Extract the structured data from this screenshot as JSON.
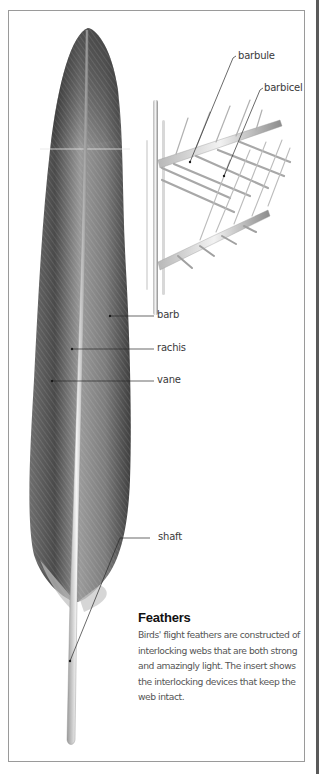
{
  "diagram": {
    "subject": "flight feather",
    "labels": {
      "barbule": "barbule",
      "barbicel": "barbicel",
      "barb": "barb",
      "rachis": "rachis",
      "vane": "vane",
      "shaft": "shaft"
    },
    "caption": {
      "title": "Feathers",
      "body": "Birds' flight feathers are constructed of interlocking webs that are both strong and amazingly light. The insert shows the interlocking devices that keep the web intact."
    },
    "colors": {
      "frame": "#9a9a9a",
      "side_bar": "#5a5a5a",
      "leader": "#2a2a2a",
      "feather_dark": "#3c3c3c",
      "feather_mid": "#8a8a8a",
      "feather_light": "#d0d0d0",
      "text": "#3a3a3a"
    }
  }
}
